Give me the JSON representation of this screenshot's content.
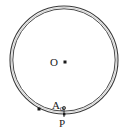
{
  "figure": {
    "type": "geometry-diagram",
    "background_color": "#ffffff",
    "stroke_color": "#3a3a3a",
    "label_color": "#1a1a1a",
    "circle": {
      "center_x": 64,
      "center_y": 60,
      "outer_radius": 54,
      "inner_radius": 51,
      "stroke_width": 1
    },
    "labels": {
      "center": "O",
      "point_a": "A",
      "point_a_subscript": "0",
      "point_p": "P"
    },
    "markers": {
      "center_dot": {
        "x": 65,
        "y": 62,
        "size": 3
      },
      "arc_dot": {
        "x": 39,
        "y": 109,
        "size": 3
      },
      "p_dot": {
        "x": 64,
        "y": 114,
        "size": 2
      },
      "p_tick": {
        "x": 64,
        "y_top": 107,
        "y_bottom": 117
      }
    }
  }
}
